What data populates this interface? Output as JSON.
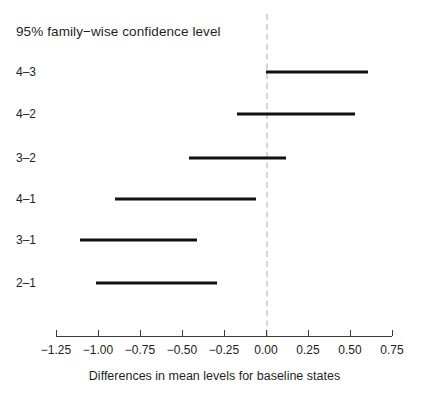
{
  "chart_data": {
    "type": "bar",
    "subtype": "confidence-interval-dotplot",
    "title": "95% family−wise confidence level",
    "xlabel": "Differences in mean levels for baseline states",
    "ylabel": "",
    "xlim": [
      -1.36,
      0.86
    ],
    "xticks": [
      -1.25,
      -1.0,
      -0.75,
      -0.5,
      -0.25,
      0.0,
      0.25,
      0.5,
      0.75
    ],
    "xtick_labels": [
      "−1.25",
      "−1.00",
      "−0.75",
      "−0.50",
      "−0.25",
      "0.00",
      "0.25",
      "0.50",
      "0.75"
    ],
    "grid": false,
    "legend": false,
    "reference_line": {
      "value": 0.0,
      "style": "dashed",
      "color": "#d6d6d6"
    },
    "categories": [
      "4–3",
      "4–2",
      "3–2",
      "4–1",
      "3–1",
      "2–1"
    ],
    "series": [
      {
        "name": "95% family-wise confidence interval",
        "color": "#111111",
        "intervals": [
          {
            "category": "4–3",
            "lower": 0.0,
            "upper": 0.61
          },
          {
            "category": "4–2",
            "lower": -0.17,
            "upper": 0.53
          },
          {
            "category": "3–2",
            "lower": -0.46,
            "upper": 0.12
          },
          {
            "category": "4–1",
            "lower": -0.9,
            "upper": -0.06
          },
          {
            "category": "3–1",
            "lower": -1.11,
            "upper": -0.41
          },
          {
            "category": "2–1",
            "lower": -1.01,
            "upper": -0.29
          }
        ]
      }
    ]
  }
}
